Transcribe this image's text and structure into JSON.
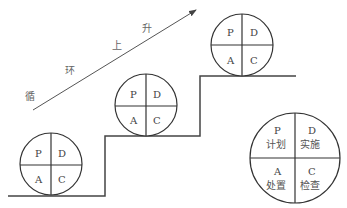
{
  "arrow": {
    "label_chars": [
      "循",
      "环",
      "上",
      "升"
    ],
    "direction": "up-right"
  },
  "stairs": {
    "steps": 3,
    "stroke_color": "#444444"
  },
  "cycles": [
    {
      "position": "bottom-step",
      "quadrants": {
        "tl": "P",
        "tr": "D",
        "bl": "A",
        "br": "C"
      }
    },
    {
      "position": "middle-step",
      "quadrants": {
        "tl": "P",
        "tr": "D",
        "bl": "A",
        "br": "C"
      }
    },
    {
      "position": "top-step",
      "quadrants": {
        "tl": "P",
        "tr": "D",
        "bl": "A",
        "br": "C"
      }
    }
  ],
  "legend": {
    "quadrants": {
      "tl": {
        "letter": "P",
        "name": "计划"
      },
      "tr": {
        "letter": "D",
        "name": "实施"
      },
      "bl": {
        "letter": "A",
        "name": "处置"
      },
      "br": {
        "letter": "C",
        "name": "检查"
      }
    }
  }
}
